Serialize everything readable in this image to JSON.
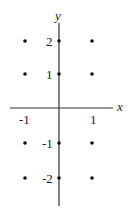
{
  "chart_data": {
    "type": "scatter",
    "title": "",
    "xlabel": "x",
    "ylabel": "y",
    "x_ticks": [
      {
        "value": -1,
        "label": "-1"
      },
      {
        "value": 1,
        "label": "1"
      }
    ],
    "y_ticks": [
      {
        "value": 2,
        "label": "2"
      },
      {
        "value": 1,
        "label": "1"
      },
      {
        "value": -1,
        "label": "-1"
      },
      {
        "value": -2,
        "label": "-2"
      }
    ],
    "points": [
      {
        "x": -1,
        "y": 2
      },
      {
        "x": 0,
        "y": 2
      },
      {
        "x": 1,
        "y": 2
      },
      {
        "x": -1,
        "y": 1
      },
      {
        "x": 0,
        "y": 1
      },
      {
        "x": 1,
        "y": 1
      },
      {
        "x": -1,
        "y": -1
      },
      {
        "x": 0,
        "y": -1
      },
      {
        "x": 1,
        "y": -1
      },
      {
        "x": -1,
        "y": -2
      },
      {
        "x": 0,
        "y": -2
      },
      {
        "x": 1,
        "y": -2
      }
    ],
    "xlim": [
      -1.5,
      1.6
    ],
    "ylim": [
      -2.8,
      2.5
    ],
    "grid": false,
    "legend": null
  }
}
